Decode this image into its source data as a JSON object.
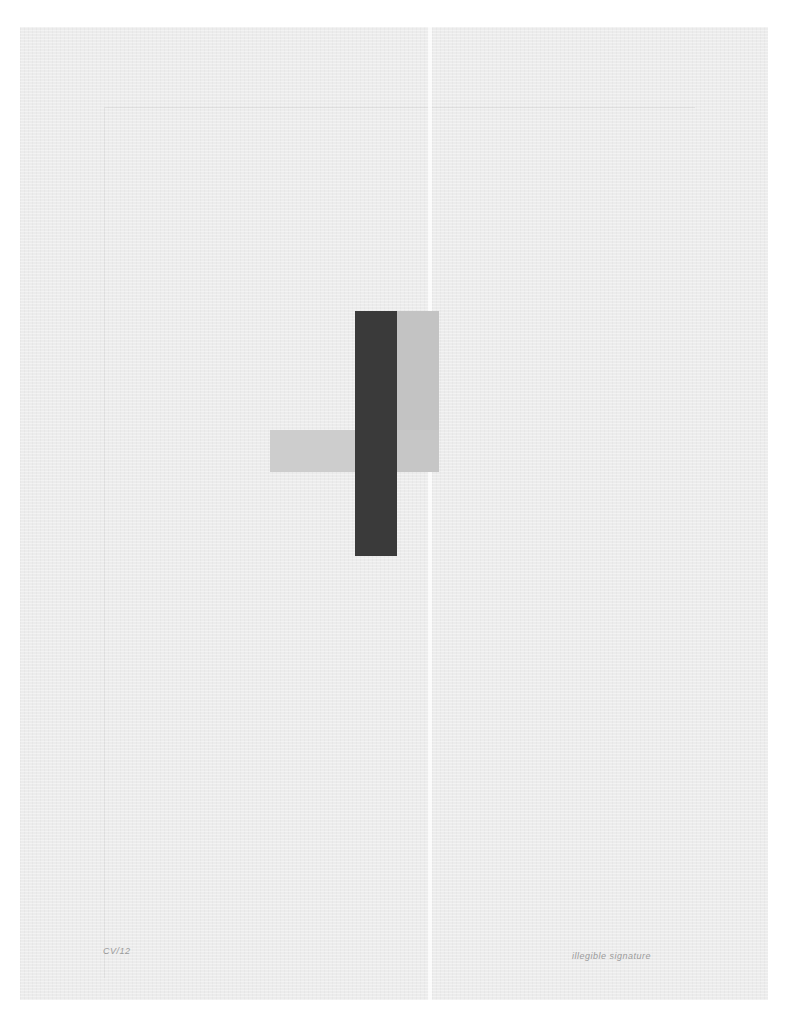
{
  "artwork": {
    "type": "geometric abstract print on textured paper",
    "paper_color": "#ececec",
    "shapes": [
      {
        "name": "dark-vertical-bar",
        "color": "#3a3a3a",
        "x": 355,
        "y": 311,
        "w": 42,
        "h": 245
      },
      {
        "name": "grey-vertical-rect",
        "color": "#c3c3c3",
        "x": 397,
        "y": 311,
        "w": 42,
        "h": 119
      },
      {
        "name": "grey-horizontal-rect",
        "color": "#cdcdcd",
        "x": 270,
        "y": 430,
        "w": 169,
        "h": 42
      }
    ],
    "inscriptions": {
      "edition": "CV/12",
      "signature": "illegible signature"
    }
  }
}
